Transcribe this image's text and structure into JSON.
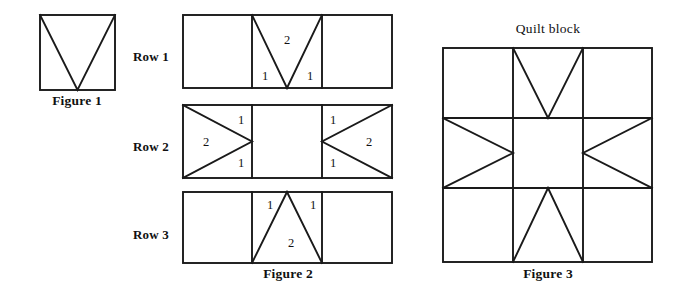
{
  "page": {
    "background_color": "#ffffff",
    "line_color": "#1a1a1a",
    "text_color": "#111111",
    "width": 685,
    "height": 303
  },
  "figure1": {
    "caption": "Figure 1",
    "shape": "square-with-inverted-triangle",
    "square": {
      "x": 40,
      "y": 15,
      "w": 75,
      "h": 75
    },
    "caption_pos": {
      "x": 77,
      "y": 94
    }
  },
  "figure2": {
    "caption": "Figure 2",
    "caption_pos": {
      "x": 288,
      "y": 267
    },
    "rows": [
      {
        "label": "Row 1",
        "label_pos": {
          "x": 133,
          "y": 50
        },
        "rect": {
          "x": 183,
          "y": 15,
          "w": 209,
          "h": 73
        },
        "cell_divider_x": [
          252,
          322
        ],
        "triangle": "inverted-v",
        "numbers": [
          {
            "text": "2",
            "x": 287,
            "y": 34
          },
          {
            "text": "1",
            "x": 265,
            "y": 76
          },
          {
            "text": "1",
            "x": 310,
            "y": 76
          }
        ]
      },
      {
        "label": "Row 2",
        "label_pos": {
          "x": 133,
          "y": 140
        },
        "rect": {
          "x": 183,
          "y": 105,
          "w": 209,
          "h": 73
        },
        "cell_divider_x": [
          252,
          322
        ],
        "triangle": "left-and-right-pointing",
        "numbers": [
          {
            "text": "1",
            "x": 241,
            "y": 118
          },
          {
            "text": "2",
            "x": 206,
            "y": 140
          },
          {
            "text": "1",
            "x": 241,
            "y": 162
          },
          {
            "text": "1",
            "x": 333,
            "y": 118
          },
          {
            "text": "2",
            "x": 369,
            "y": 140
          },
          {
            "text": "1",
            "x": 333,
            "y": 162
          }
        ]
      },
      {
        "label": "Row 3",
        "label_pos": {
          "x": 133,
          "y": 228
        },
        "rect": {
          "x": 183,
          "y": 192,
          "w": 209,
          "h": 71
        },
        "cell_divider_x": [
          252,
          322
        ],
        "triangle": "upright-v",
        "numbers": [
          {
            "text": "1",
            "x": 270,
            "y": 204
          },
          {
            "text": "1",
            "x": 313,
            "y": 204
          },
          {
            "text": "2",
            "x": 291,
            "y": 243
          }
        ]
      }
    ]
  },
  "figure3": {
    "caption": "Figure 3",
    "title": "Quilt block",
    "title_pos": {
      "x": 548,
      "y": 32
    },
    "caption_pos": {
      "x": 548,
      "y": 267
    },
    "block": {
      "x": 443,
      "y": 48,
      "w": 209,
      "h": 214
    },
    "grid_x": [
      513,
      583
    ],
    "grid_y": [
      118,
      188
    ]
  }
}
